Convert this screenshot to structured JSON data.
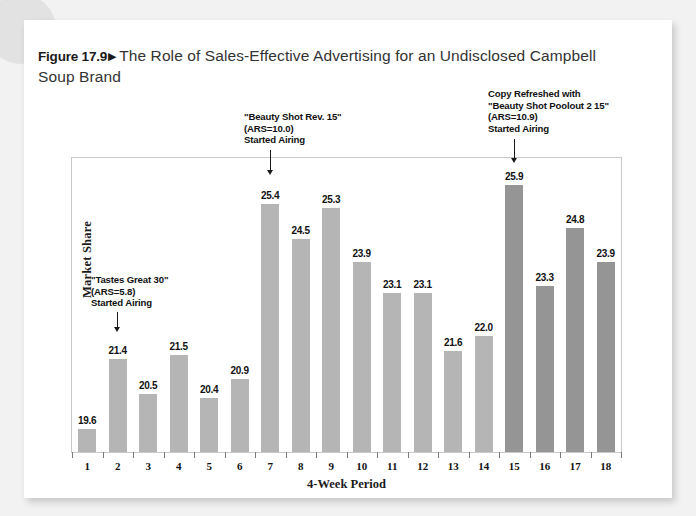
{
  "figure": {
    "number": "Figure 17.9",
    "marker": "▶",
    "title": "The Role of Sales-Effective Advertising for an Undisclosed Campbell Soup Brand"
  },
  "colors": {
    "bar_light": "#b5b5b5",
    "bar_dark": "#959595",
    "page": "#ffffff",
    "background": "#f2f2f2",
    "frame": "#c9c9c9",
    "text": "#111111"
  },
  "chart_data": {
    "type": "bar",
    "title": "The Role of Sales-Effective Advertising for an Undisclosed Campbell Soup Brand",
    "xlabel": "4-Week Period",
    "ylabel": "Market Share",
    "categories": [
      "1",
      "2",
      "3",
      "4",
      "5",
      "6",
      "7",
      "8",
      "9",
      "10",
      "11",
      "12",
      "13",
      "14",
      "15",
      "16",
      "17",
      "18"
    ],
    "values": [
      19.6,
      21.4,
      20.5,
      21.5,
      20.4,
      20.9,
      25.4,
      24.5,
      25.3,
      23.9,
      23.1,
      23.1,
      21.6,
      22.0,
      25.9,
      23.3,
      24.8,
      23.9
    ],
    "value_labels": [
      "19.6",
      "21.4",
      "20.5",
      "21.5",
      "20.4",
      "20.9",
      "25.4",
      "24.5",
      "25.3",
      "23.9",
      "23.1",
      "23.1",
      "21.6",
      "22.0",
      "25.9",
      "23.3",
      "24.8",
      "23.9"
    ],
    "bar_shades": [
      "light",
      "light",
      "light",
      "light",
      "light",
      "light",
      "light",
      "light",
      "light",
      "light",
      "light",
      "light",
      "light",
      "light",
      "dark",
      "dark",
      "dark",
      "dark"
    ],
    "ylim": [
      19.0,
      26.6
    ],
    "grid": false,
    "legend": "none",
    "y_axis_ticks_shown": false,
    "annotations": [
      {
        "id": "tastes-great",
        "text": "\"Tastes Great 30\"\n(ARS=5.8)\nStarted Airing",
        "points_to_category": "2"
      },
      {
        "id": "beauty-shot-rev15",
        "text": "\"Beauty Shot Rev. 15\"\n(ARS=10.0)\nStarted Airing",
        "points_to_category": "7"
      },
      {
        "id": "beauty-shot-poolout",
        "text": "Copy Refreshed with\n\"Beauty Shot Poolout 2 15\"\n(ARS=10.9)\nStarted Airing",
        "points_to_category": "15"
      }
    ]
  }
}
